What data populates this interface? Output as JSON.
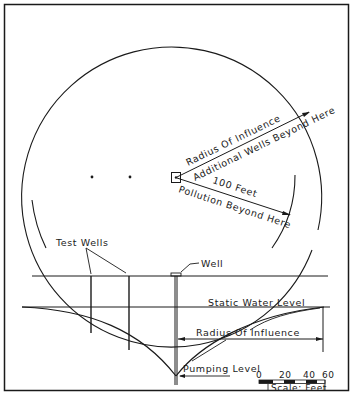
{
  "plan_view": {
    "radius_label": "Radius Of Influence",
    "additional_wells_label": "Additional Wells Beyond Here",
    "distance_label": "100 Feet",
    "pollution_label": "Pollution Beyond Here"
  },
  "section_view": {
    "test_wells_label": "Test Wells",
    "well_label": "Well",
    "static_water_label": "Static Water Level",
    "radius_label": "Radius Of Influence",
    "pumping_level_label": "Pumping Level"
  },
  "scale_bar": {
    "ticks": [
      "0",
      "20",
      "40",
      "60"
    ],
    "caption": "Scale: Feet"
  },
  "colors": {
    "ink": "#1a1a1a",
    "paper": "#ffffff"
  }
}
